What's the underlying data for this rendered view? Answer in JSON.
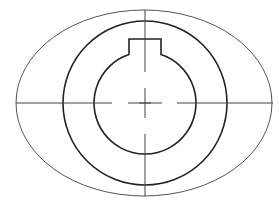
{
  "figure": {
    "type": "technical-drawing",
    "components": [
      "outer-ellipse",
      "outer-circle",
      "inner-bore-with-keyway",
      "horizontal-centerline",
      "vertical-centerline",
      "center-mark"
    ],
    "colors": {
      "background": "#ffffff",
      "thin_line": "#555555",
      "thick_line": "#222222",
      "centerline": "#444444"
    }
  }
}
